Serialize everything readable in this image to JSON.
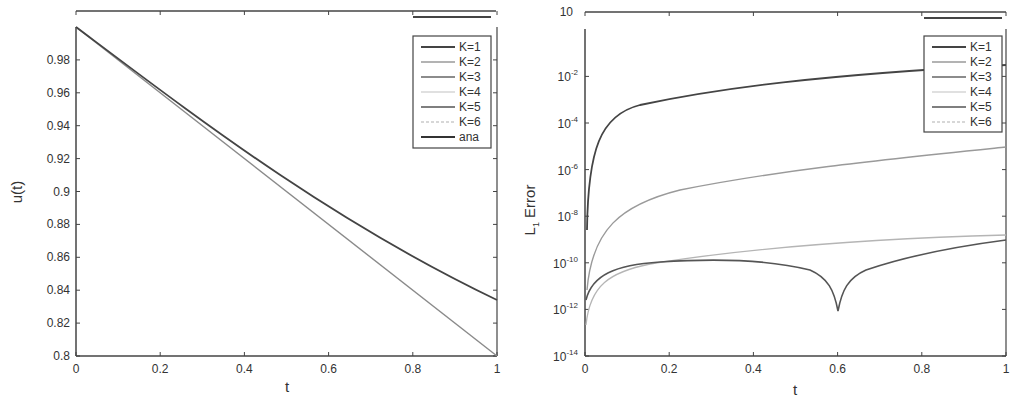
{
  "chart_data": [
    {
      "type": "line",
      "title": "",
      "xlabel": "t",
      "ylabel": "u(t)",
      "xlim": [
        0,
        1
      ],
      "ylim": [
        0.8,
        1.0
      ],
      "grid": false,
      "legend_position": "upper right",
      "x_ticks": [
        "0",
        "0.2",
        "0.4",
        "0.6",
        "0.8",
        "1"
      ],
      "y_ticks": [
        "0.8",
        "0.82",
        "0.84",
        "0.86",
        "0.88",
        "0.9",
        "0.92",
        "0.94",
        "0.96",
        "0.98"
      ],
      "x": [
        0,
        0.1,
        0.2,
        0.3,
        0.4,
        0.5,
        0.6,
        0.7,
        0.8,
        0.9,
        1.0
      ],
      "series": [
        {
          "name": "K=1",
          "color": "#555555",
          "values": [
            1.0,
            0.98,
            0.96,
            0.94,
            0.92,
            0.9,
            0.88,
            0.86,
            0.84,
            0.82,
            0.8
          ]
        },
        {
          "name": "K=2",
          "color": "#999999",
          "values": [
            1.0,
            0.9804,
            0.9615,
            0.9434,
            0.9259,
            0.9091,
            0.8929,
            0.8772,
            0.8621,
            0.8475,
            0.8333
          ]
        },
        {
          "name": "K=3",
          "color": "#777777",
          "values": [
            1.0,
            0.9804,
            0.9615,
            0.9434,
            0.9259,
            0.9091,
            0.8929,
            0.8772,
            0.8621,
            0.8475,
            0.8333
          ]
        },
        {
          "name": "K=4",
          "color": "#bbbbbb",
          "values": [
            1.0,
            0.9804,
            0.9615,
            0.9434,
            0.9259,
            0.9091,
            0.8929,
            0.8772,
            0.8621,
            0.8475,
            0.8333
          ]
        },
        {
          "name": "K=5",
          "color": "#666666",
          "values": [
            1.0,
            0.9804,
            0.9615,
            0.9434,
            0.9259,
            0.9091,
            0.8929,
            0.8772,
            0.8621,
            0.8475,
            0.8333
          ]
        },
        {
          "name": "K=6",
          "color": "#aaaaaa",
          "values": [
            1.0,
            0.9804,
            0.9615,
            0.9434,
            0.9259,
            0.9091,
            0.8929,
            0.8772,
            0.8621,
            0.8475,
            0.8333
          ]
        },
        {
          "name": "ana",
          "color": "#444444",
          "values": [
            1.0,
            0.9804,
            0.9615,
            0.9434,
            0.9259,
            0.9091,
            0.8929,
            0.8772,
            0.8621,
            0.8475,
            0.8333
          ]
        }
      ],
      "legend": [
        "K=1",
        "K=2",
        "K=3",
        "K=4",
        "K=5",
        "K=6",
        "ana"
      ]
    },
    {
      "type": "line",
      "title": "",
      "xlabel": "t",
      "ylabel": "L1 Error",
      "yscale": "log",
      "xlim": [
        0,
        1
      ],
      "ylim": [
        1e-14,
        10
      ],
      "grid": false,
      "legend_position": "upper right",
      "x_ticks": [
        "0",
        "0.2",
        "0.4",
        "0.6",
        "0.8",
        "1"
      ],
      "y_ticks": [
        "10^-14",
        "10^-12",
        "10^-10",
        "10^-8",
        "10^-6",
        "10^-4",
        "10^-2",
        "10"
      ],
      "x": [
        0.001,
        0.02,
        0.05,
        0.1,
        0.2,
        0.3,
        0.4,
        0.5,
        0.55,
        0.6,
        0.65,
        0.7,
        0.8,
        0.9,
        1.0
      ],
      "series": [
        {
          "name": "K=1",
          "color": "#444444",
          "values": [
            1e-06,
            5e-05,
            0.00015,
            0.0004,
            0.0012,
            0.0025,
            0.004,
            0.006,
            0.007,
            0.008,
            0.009,
            0.01,
            0.014,
            0.018,
            0.022
          ]
        },
        {
          "name": "K=2",
          "color": "#999999",
          "values": [
            1e-10,
            3e-08,
            1.2e-07,
            3e-07,
            7e-07,
            1.2e-06,
            1.7e-06,
            2.3e-06,
            2.6e-06,
            3e-06,
            3.4e-06,
            3.8e-06,
            4.8e-06,
            6e-06,
            7.5e-06
          ]
        },
        {
          "name": "K=3",
          "color": "#777777",
          "values": [
            1e-11,
            4e-11,
            1e-10,
            1.6e-10,
            2.2e-10,
            2.5e-10,
            2.4e-10,
            1.8e-10,
            9e-11,
            1e-12,
            9e-11,
            1.8e-10,
            3.5e-10,
            5.5e-10,
            8e-10
          ]
        },
        {
          "name": "K=4",
          "color": "#bbbbbb",
          "values": [
            2e-12,
            3e-11,
            9e-11,
            1.6e-10,
            2.6e-10,
            3.5e-10,
            4.5e-10,
            5.5e-10,
            6e-10,
            6.5e-10,
            7e-10,
            7.5e-10,
            8.5e-10,
            1e-09,
            1.1e-09
          ]
        },
        {
          "name": "K=5",
          "color": "#666666",
          "values": [
            1e-11,
            4e-11,
            1e-10,
            1.6e-10,
            2.2e-10,
            2.5e-10,
            2.4e-10,
            1.8e-10,
            9e-11,
            1e-12,
            9e-11,
            1.8e-10,
            3.5e-10,
            5.5e-10,
            8e-10
          ]
        },
        {
          "name": "K=6",
          "color": "#aaaaaa",
          "values": [
            2e-12,
            3e-11,
            9e-11,
            1.6e-10,
            2.6e-10,
            3.5e-10,
            4.5e-10,
            5.5e-10,
            6e-10,
            6.5e-10,
            7e-10,
            7.5e-10,
            8.5e-10,
            1e-09,
            1.1e-09
          ]
        }
      ],
      "legend": [
        "K=1",
        "K=2",
        "K=3",
        "K=4",
        "K=5",
        "K=6"
      ]
    }
  ],
  "left_chart": {
    "xlabel": "t",
    "ylabel": "u(t)",
    "x_ticks": [
      "0",
      "0.2",
      "0.4",
      "0.6",
      "0.8",
      "1"
    ],
    "y_ticks": [
      "0.8",
      "0.82",
      "0.84",
      "0.86",
      "0.88",
      "0.9",
      "0.92",
      "0.94",
      "0.96",
      "0.98"
    ],
    "legend": [
      "K=1",
      "K=2",
      "K=3",
      "K=4",
      "K=5",
      "K=6",
      "ana"
    ]
  },
  "right_chart": {
    "xlabel": "t",
    "ylabel_main": "L",
    "ylabel_sub": "1",
    "ylabel_rest": " Error",
    "x_ticks": [
      "0",
      "0.2",
      "0.4",
      "0.6",
      "0.8",
      "1"
    ],
    "y_ticks_exp": [
      "-14",
      "-12",
      "-10",
      "-8",
      "-6",
      "-4",
      "-2"
    ],
    "y_tick_top": "10",
    "legend": [
      "K=1",
      "K=2",
      "K=3",
      "K=4",
      "K=5",
      "K=6"
    ]
  }
}
